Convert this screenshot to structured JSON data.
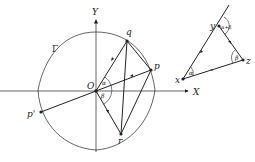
{
  "diagram": {
    "left_figure": {
      "axes": {
        "x_label": "X",
        "y_label": "Y",
        "origin_label": "O"
      },
      "curve_label": "Γ",
      "points": {
        "q": "q",
        "p": "p",
        "p_prime": "p'",
        "r": "r"
      },
      "angles": {
        "alpha": "α",
        "beta": "β"
      }
    },
    "right_figure": {
      "points": {
        "x": "x",
        "y": "y",
        "z": "z"
      },
      "angles": {
        "alpha": "α",
        "beta": "β",
        "alpha_plus_beta": "α+β"
      }
    },
    "colors": {
      "stroke": "#222222",
      "background": "#ffffff"
    }
  }
}
